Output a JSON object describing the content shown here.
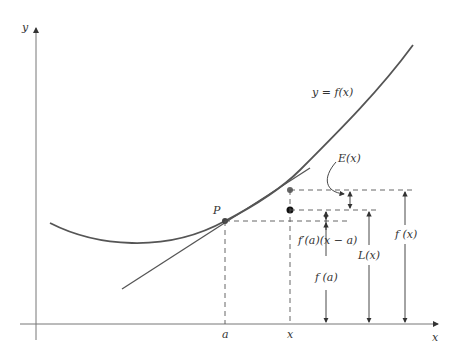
{
  "diagram": {
    "axes": {
      "x_label": "x",
      "y_label": "y"
    },
    "curve_label": "y = f(x)",
    "point_label": "P",
    "tick_labels": {
      "a": "a",
      "x": "x"
    },
    "measures": {
      "error": "E(x)",
      "increment": "f′(a)(x − a)",
      "fa": "f (a)",
      "Lx": "L(x)",
      "fx": "f (x)"
    },
    "colors": {
      "curve": "#555555",
      "axis": "#777777",
      "text": "#333333"
    }
  }
}
